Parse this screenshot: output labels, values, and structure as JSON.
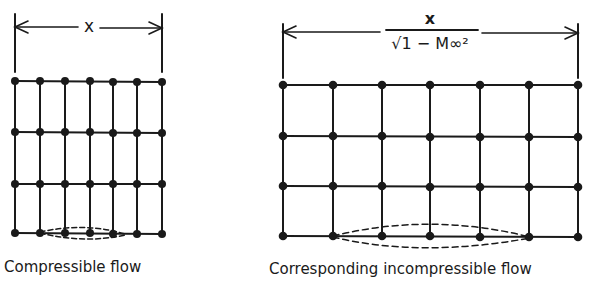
{
  "figure": {
    "left_panel": {
      "caption": "Compressible flow",
      "dimension_label": "x",
      "grid": {
        "columns_x": [
          15,
          40,
          65,
          90,
          113,
          137,
          162
        ],
        "rows_y": [
          81,
          132,
          184,
          233
        ]
      }
    },
    "right_panel": {
      "caption": "Corresponding incompressible flow",
      "dimension_label_numerator": "x",
      "dimension_label_denominator": "√1 − M∞²",
      "grid": {
        "columns_x": [
          283,
          333,
          382,
          430,
          480,
          529,
          578
        ],
        "rows_y": [
          85,
          136,
          186,
          236
        ]
      }
    },
    "line_color": "#1a1a1a"
  }
}
